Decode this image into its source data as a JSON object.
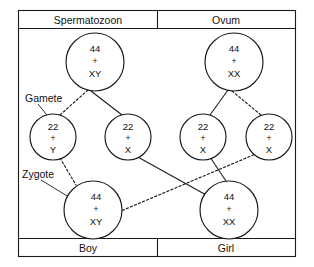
{
  "diagram": {
    "headers": [
      {
        "id": "spermatozoon",
        "label": "Spermatozoon"
      },
      {
        "id": "ovum",
        "label": "Ovum"
      }
    ],
    "footers": [
      {
        "id": "boy",
        "label": "Boy"
      },
      {
        "id": "girl",
        "label": "Girl"
      }
    ],
    "annotations": [
      {
        "id": "gamete",
        "label": "Gamete"
      },
      {
        "id": "zygote",
        "label": "Zygote"
      }
    ],
    "cells": [
      {
        "id": "sperm-parent",
        "role": "parent",
        "parent_of": "spermatozoon",
        "autosomes": "44",
        "plus": "+",
        "sex_chromosomes": "XY",
        "cx": 95,
        "cy": 62,
        "r": 29
      },
      {
        "id": "ovum-parent",
        "role": "parent",
        "parent_of": "ovum",
        "autosomes": "44",
        "plus": "+",
        "sex_chromosomes": "XX",
        "cx": 234,
        "cy": 62,
        "r": 29
      },
      {
        "id": "sperm-gamete-y",
        "role": "gamete",
        "parent_of": "spermatozoon",
        "autosomes": "22",
        "plus": "+",
        "sex_chromosomes": "Y",
        "cx": 53,
        "cy": 137,
        "r": 23
      },
      {
        "id": "sperm-gamete-x",
        "role": "gamete",
        "parent_of": "spermatozoon",
        "autosomes": "22",
        "plus": "+",
        "sex_chromosomes": "X",
        "cx": 128,
        "cy": 137,
        "r": 23
      },
      {
        "id": "ovum-gamete-x-left",
        "role": "gamete",
        "parent_of": "ovum",
        "autosomes": "22",
        "plus": "+",
        "sex_chromosomes": "X",
        "cx": 203,
        "cy": 137,
        "r": 23
      },
      {
        "id": "ovum-gamete-x-right",
        "role": "gamete",
        "parent_of": "ovum",
        "autosomes": "22",
        "plus": "+",
        "sex_chromosomes": "X",
        "cx": 269,
        "cy": 137,
        "r": 23
      },
      {
        "id": "zygote-boy",
        "role": "zygote",
        "parent_of": "boy",
        "autosomes": "44",
        "plus": "+",
        "sex_chromosomes": "XY",
        "cx": 93,
        "cy": 210,
        "r": 29
      },
      {
        "id": "zygote-girl",
        "role": "zygote",
        "parent_of": "girl",
        "autosomes": "44",
        "plus": "+",
        "sex_chromosomes": "XX",
        "cx": 229,
        "cy": 210,
        "r": 29
      }
    ],
    "connections": [
      {
        "id": "sperm-to-y",
        "style": "dashed",
        "from": "sperm-parent",
        "to": "sperm-gamete-y"
      },
      {
        "id": "sperm-to-x",
        "style": "solid",
        "from": "sperm-parent",
        "to": "sperm-gamete-x"
      },
      {
        "id": "ovum-to-x-left",
        "style": "solid",
        "from": "ovum-parent",
        "to": "ovum-gamete-x-left"
      },
      {
        "id": "ovum-to-x-right",
        "style": "dashed",
        "from": "ovum-parent",
        "to": "ovum-gamete-x-right"
      },
      {
        "id": "y-to-boy",
        "style": "dashed",
        "from": "sperm-gamete-y",
        "to": "zygote-boy"
      },
      {
        "id": "x-sperm-to-girl",
        "style": "solid",
        "from": "sperm-gamete-x",
        "to": "zygote-girl"
      },
      {
        "id": "x-ovum-left-to-girl",
        "style": "solid",
        "from": "ovum-gamete-x-left",
        "to": "zygote-girl"
      },
      {
        "id": "x-ovum-right-to-boy",
        "style": "dashed",
        "from": "ovum-gamete-x-right",
        "to": "zygote-boy"
      }
    ],
    "colors": {
      "stroke": "#1a1a1a",
      "background": "#ffffff",
      "text": "#111111"
    }
  }
}
